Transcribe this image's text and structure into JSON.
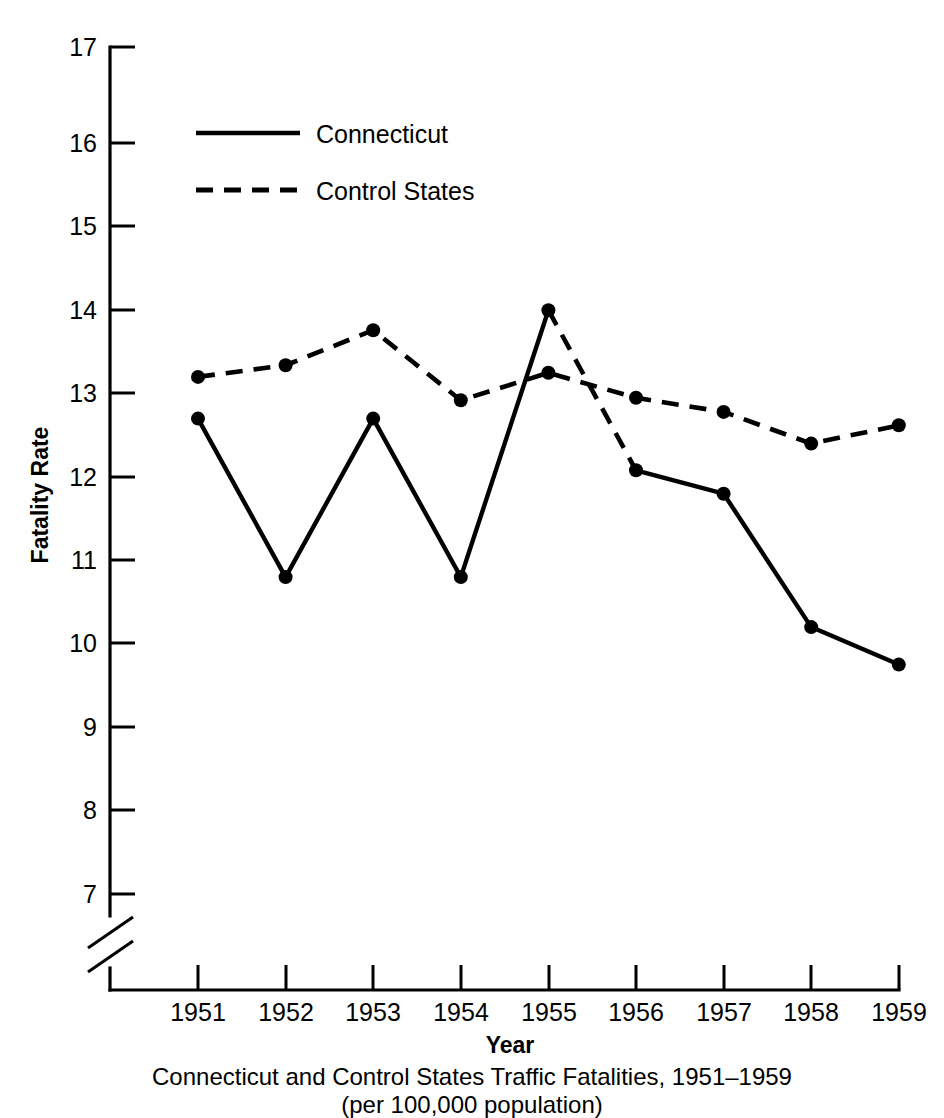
{
  "chart_data": {
    "type": "line",
    "title": "Connecticut and Control States Traffic Fatalities, 1951–1959",
    "subtitle": "(per 100,000 population)",
    "xlabel": "Year",
    "ylabel": "Fatality Rate",
    "categories": [
      "1951",
      "1952",
      "1953",
      "1954",
      "1955",
      "1956",
      "1957",
      "1958",
      "1959"
    ],
    "x": [
      1951,
      1952,
      1953,
      1954,
      1955,
      1956,
      1957,
      1958,
      1959
    ],
    "series": [
      {
        "name": "Connecticut",
        "style": "solid",
        "values": [
          12.7,
          10.8,
          12.7,
          10.8,
          14.0,
          12.08,
          11.8,
          10.2,
          9.75
        ]
      },
      {
        "name": "Control States",
        "style": "dashed",
        "values": [
          13.2,
          13.34,
          13.76,
          12.92,
          13.25,
          12.95,
          12.78,
          12.4,
          12.62
        ]
      }
    ],
    "ylim": [
      6.6,
      17
    ],
    "yticks": [
      7,
      8,
      9,
      10,
      11,
      12,
      13,
      14,
      15,
      16,
      17
    ],
    "ytick_labels": [
      "7",
      "8",
      "9",
      "10",
      "11",
      "12",
      "13",
      "14",
      "15",
      "16",
      "17"
    ],
    "y_axis_break": true,
    "y_axis_break_note": "axis break below 7",
    "grid": false,
    "legend_position": "upper left inside plot",
    "legend_entries": [
      "Connecticut",
      "Control States"
    ],
    "line_color": "#000000",
    "background_color": "#ffffff"
  }
}
